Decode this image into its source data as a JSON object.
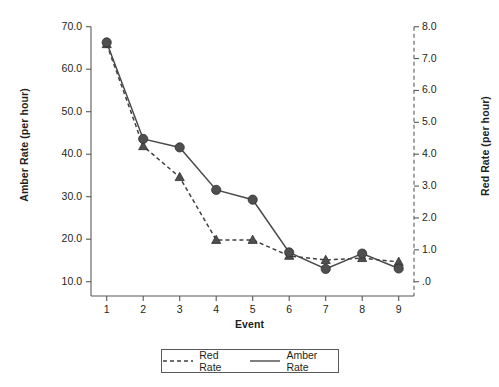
{
  "chart_data": {
    "type": "line",
    "title": "",
    "xlabel": "Event",
    "ylabel": "Amber Rate (per hour)",
    "y2label": "Red Rate (per hour)",
    "categories": [
      "1",
      "2",
      "3",
      "4",
      "5",
      "6",
      "7",
      "8",
      "9"
    ],
    "x": [
      1,
      2,
      3,
      4,
      5,
      6,
      7,
      8,
      9
    ],
    "xlim": [
      0.5,
      9.7
    ],
    "ylim": [
      5.0,
      70.0
    ],
    "y2lim": [
      0.0,
      8.0
    ],
    "yticks": [
      "10.0",
      "20.0",
      "30.0",
      "40.0",
      "50.0",
      "60.0",
      "70.0"
    ],
    "ytick_values": [
      10,
      20,
      30,
      40,
      50,
      60,
      70
    ],
    "y2ticks": [
      ".0",
      "1.0",
      "2.0",
      "3.0",
      "4.0",
      "5.0",
      "6.0",
      "7.0",
      "8.0"
    ],
    "y2tick_values": [
      0,
      1,
      2,
      3,
      4,
      5,
      6,
      7,
      8
    ],
    "xticks": [
      "1",
      "2",
      "3",
      "4",
      "5",
      "6",
      "7",
      "8",
      "9"
    ],
    "grid": false,
    "legend_position": "bottom",
    "series": [
      {
        "name": "Red Rate",
        "axis": "right",
        "line_style": "dashed",
        "marker": "triangle",
        "color": "#404040",
        "values": [
          7.45,
          4.25,
          3.28,
          1.31,
          1.31,
          0.81,
          0.68,
          0.74,
          0.62
        ]
      },
      {
        "name": "Amber Rate",
        "axis": "left",
        "line_style": "solid",
        "marker": "circle",
        "color": "#4a4a4a",
        "values": [
          66.3,
          43.6,
          41.6,
          31.6,
          29.3,
          16.9,
          13.0,
          16.6,
          13.1
        ]
      }
    ]
  },
  "legend": {
    "entries": [
      {
        "label": "Red Rate",
        "style": "dashed"
      },
      {
        "label": "Amber Rate",
        "style": "solid"
      }
    ]
  },
  "colors": {
    "marker": "#4f4f4f",
    "line": "#4a4a4a",
    "axis": "#58595b",
    "text": "#231f20"
  }
}
